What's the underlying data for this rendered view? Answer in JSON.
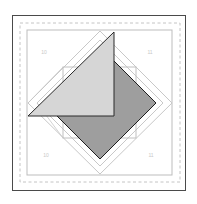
{
  "diagram": {
    "type": "quilt-block",
    "colors": {
      "background": "#ffffff",
      "outer_frame": "#4a4a4a",
      "seam_dashed": "#c4c4c4",
      "block_outline": "#bdbdbd",
      "diamond_outline": "#c8c8c8",
      "center_square": "#9e9e9e",
      "center_square_stroke": "#1e1e1e",
      "triangle_fill": "#d6d6d6",
      "triangle_stroke": "#2a2a2a"
    },
    "labels": {
      "top_left": "10",
      "top_right": "11",
      "bottom_left": "10",
      "bottom_right": "11"
    }
  }
}
